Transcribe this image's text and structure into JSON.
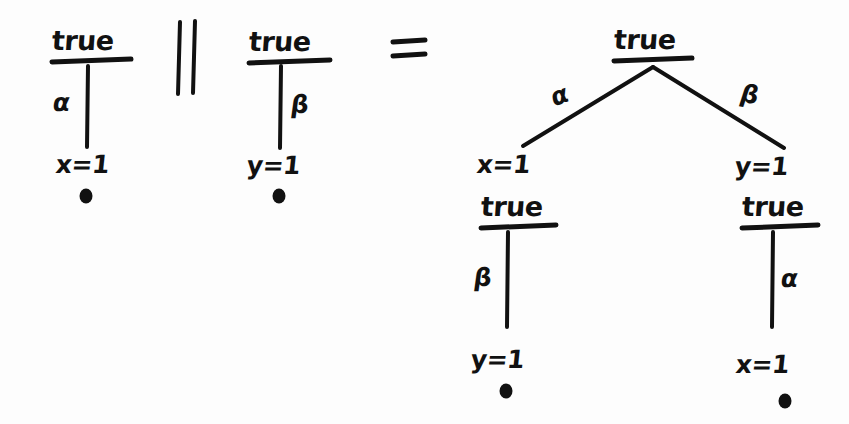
{
  "figure": {
    "kind": "hand-drawn-diagram",
    "background_color": "#fdfdfd",
    "ink_color": "#111111"
  },
  "operators": {
    "parallel": "||",
    "equals": "="
  },
  "left_operand": {
    "root_label": "true",
    "edge_label": "α",
    "leaf_label": "x=1",
    "terminal_marker": "•"
  },
  "right_operand": {
    "root_label": "true",
    "edge_label": "β",
    "leaf_label": "y=1",
    "terminal_marker": "•"
  },
  "result_tree": {
    "root_label": "true",
    "branches": [
      {
        "edge_label": "α",
        "node_label": "x=1",
        "state_label": "true",
        "child_edge_label": "β",
        "leaf_label": "y=1",
        "terminal_marker": "•"
      },
      {
        "edge_label": "β",
        "node_label": "y=1",
        "state_label": "true",
        "child_edge_label": "α",
        "leaf_label": "x=1",
        "terminal_marker": "•"
      }
    ]
  }
}
